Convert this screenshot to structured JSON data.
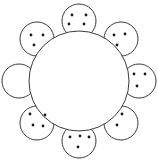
{
  "figure": {
    "background_color": "#ffffff",
    "stroke_color": "#3a3a3a",
    "dot_color": "#1a1a1a",
    "canvas": {
      "width": 158,
      "height": 161
    }
  },
  "center": {
    "label": "center-circle",
    "cx": 79,
    "cy": 81,
    "r": 50,
    "dot_count": 0
  },
  "petals": [
    {
      "label": "petal-n",
      "position": "top",
      "angle_deg": 270,
      "cx": 79,
      "cy": 21,
      "r": 17,
      "dot_count": 4,
      "dots": [
        {
          "cx": 72,
          "cy": 15,
          "r": 1.4
        },
        {
          "cx": 86,
          "cy": 15,
          "r": 1.4
        },
        {
          "cx": 69,
          "cy": 24,
          "r": 1.4
        },
        {
          "cx": 84,
          "cy": 24,
          "r": 1.4
        }
      ]
    },
    {
      "label": "petal-ne",
      "position": "top-right",
      "angle_deg": 315,
      "cx": 121,
      "cy": 39,
      "r": 17,
      "dot_count": 3,
      "dots": [
        {
          "cx": 114,
          "cy": 35,
          "r": 1.4
        },
        {
          "cx": 125,
          "cy": 34,
          "r": 1.4
        },
        {
          "cx": 117,
          "cy": 45,
          "r": 1.4
        }
      ]
    },
    {
      "label": "petal-e",
      "position": "right",
      "angle_deg": 0,
      "cx": 139,
      "cy": 81,
      "r": 17,
      "dot_count": 3,
      "dots": [
        {
          "cx": 134,
          "cy": 74,
          "r": 1.4
        },
        {
          "cx": 145,
          "cy": 74,
          "r": 1.4
        },
        {
          "cx": 137,
          "cy": 86,
          "r": 1.4
        }
      ]
    },
    {
      "label": "petal-se",
      "position": "bottom-right",
      "angle_deg": 45,
      "cx": 121,
      "cy": 123,
      "r": 17,
      "dot_count": 2,
      "dots": [
        {
          "cx": 122,
          "cy": 114,
          "r": 1.4
        },
        {
          "cx": 117,
          "cy": 125,
          "r": 1.4
        }
      ]
    },
    {
      "label": "petal-s",
      "position": "bottom",
      "angle_deg": 90,
      "cx": 79,
      "cy": 141,
      "r": 17,
      "dot_count": 4,
      "dots": [
        {
          "cx": 70,
          "cy": 137,
          "r": 1.4
        },
        {
          "cx": 80,
          "cy": 136,
          "r": 1.4
        },
        {
          "cx": 89,
          "cy": 137,
          "r": 1.4
        },
        {
          "cx": 78,
          "cy": 147,
          "r": 1.4
        }
      ]
    },
    {
      "label": "petal-sw",
      "position": "bottom-left",
      "angle_deg": 135,
      "cx": 37,
      "cy": 123,
      "r": 17,
      "dot_count": 4,
      "dots": [
        {
          "cx": 30,
          "cy": 114,
          "r": 1.4
        },
        {
          "cx": 45,
          "cy": 115,
          "r": 1.4
        },
        {
          "cx": 33,
          "cy": 125,
          "r": 1.4
        },
        {
          "cx": 43,
          "cy": 126,
          "r": 1.4
        }
      ]
    },
    {
      "label": "petal-w",
      "position": "left",
      "angle_deg": 180,
      "cx": 19,
      "cy": 81,
      "r": 17,
      "dot_count": 0,
      "dots": []
    },
    {
      "label": "petal-nw",
      "position": "top-left",
      "angle_deg": 225,
      "cx": 37,
      "cy": 39,
      "r": 17,
      "dot_count": 3,
      "dots": [
        {
          "cx": 31,
          "cy": 35,
          "r": 1.4
        },
        {
          "cx": 43,
          "cy": 35,
          "r": 1.4
        },
        {
          "cx": 34,
          "cy": 45,
          "r": 1.4
        }
      ]
    }
  ]
}
